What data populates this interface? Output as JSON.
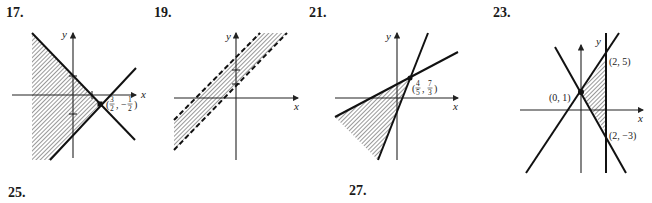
{
  "problems": [
    {
      "number": "17.",
      "axes": {
        "x": "x",
        "y": "y"
      },
      "points": [
        {
          "label": "(3/2, −1/2)",
          "num1": "3",
          "den1": "2",
          "sign": "−",
          "num2": "1",
          "den2": "2"
        }
      ],
      "boundary": "solid"
    },
    {
      "number": "19.",
      "axes": {
        "x": "x",
        "y": "y"
      },
      "points": [],
      "boundary": "dashed"
    },
    {
      "number": "21.",
      "axes": {
        "x": "x",
        "y": "y"
      },
      "points": [
        {
          "label": "(4/5, 7/3)",
          "num1": "4",
          "den1": "5",
          "num2": "7",
          "den2": "3"
        }
      ],
      "boundary": "solid"
    },
    {
      "number": "23.",
      "axes": {
        "x": "x",
        "y": "y"
      },
      "points": [
        {
          "label": "(2, 5)"
        },
        {
          "label": "(0, 1)"
        },
        {
          "label": "(2, −3)"
        }
      ],
      "boundary": "solid"
    },
    {
      "number": "25."
    },
    {
      "number": "27."
    }
  ]
}
